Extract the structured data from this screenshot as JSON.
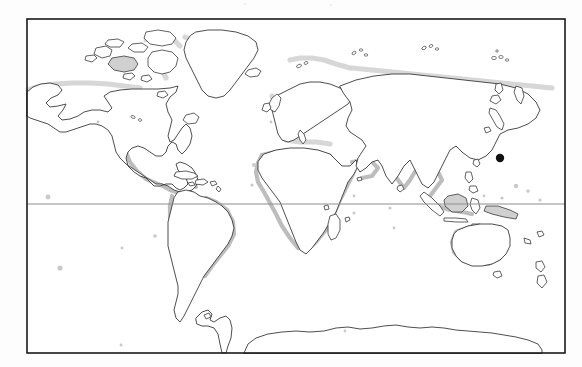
{
  "figure": {
    "kind": "world-map",
    "projection": "equirectangular",
    "background_color": "#fdfdfd",
    "plate_color": "#ffffff",
    "frame_color": "#1a1a1a",
    "coastline_color": "#3a3a3a",
    "coastal_shading_color": "#b9b9b9",
    "equator_color": "#8e8e8e",
    "marker_color": "#111111",
    "frame": {
      "left": 27,
      "top": 19,
      "right": 565,
      "bottom": 353
    },
    "gridlines": [
      {
        "name": "equator",
        "orientation": "horizontal",
        "y": 204,
        "label": ""
      }
    ],
    "markers": [
      {
        "name": "pacific-point-marker",
        "x": 500,
        "y": 158,
        "radius": 4.2,
        "label": ""
      }
    ],
    "regions": [
      {
        "name": "north-america",
        "shaded_coast": true
      },
      {
        "name": "greenland",
        "shaded_coast": true
      },
      {
        "name": "south-america",
        "shaded_coast": true
      },
      {
        "name": "africa",
        "shaded_coast": true
      },
      {
        "name": "europe",
        "shaded_coast": true
      },
      {
        "name": "asia",
        "shaded_coast": true
      },
      {
        "name": "australia",
        "shaded_coast": true
      },
      {
        "name": "antarctica",
        "shaded_coast": false
      },
      {
        "name": "canadian-arctic-archipelago",
        "shaded_coast": true
      },
      {
        "name": "indonesia-archipelago",
        "shaded_coast": true
      },
      {
        "name": "japan",
        "shaded_coast": false
      },
      {
        "name": "new-zealand",
        "shaded_coast": false
      },
      {
        "name": "madagascar",
        "shaded_coast": false
      },
      {
        "name": "british-isles",
        "shaded_coast": true
      },
      {
        "name": "iceland",
        "shaded_coast": false
      }
    ],
    "legend": {
      "visible": false,
      "entries": []
    },
    "axis_labels": {
      "visible": false,
      "x": "",
      "y": ""
    }
  }
}
